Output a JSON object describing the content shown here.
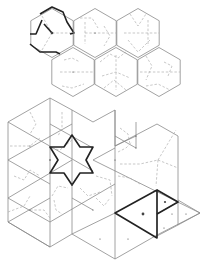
{
  "figure": {
    "colors": {
      "solid": "#8a8a8a",
      "dashed": "#b0b0b0",
      "bold": "#222222",
      "background": "#ffffff"
    },
    "top_panel": {
      "hexagons": [
        {
          "cx": 52,
          "cy": 33,
          "highlighted": true
        },
        {
          "cx": 95,
          "cy": 33,
          "highlighted": false
        },
        {
          "cx": 138,
          "cy": 33,
          "highlighted": false
        },
        {
          "cx": 73,
          "cy": 72,
          "highlighted": false
        },
        {
          "cx": 116,
          "cy": 72,
          "highlighted": false
        },
        {
          "cx": 159,
          "cy": 72,
          "highlighted": false
        }
      ],
      "hex_radius": 24.5
    },
    "bottom_panel": {
      "star": {
        "cx": 72,
        "cy": 160,
        "outer_radius": 26,
        "inner_radius": 15
      },
      "bold_triangle": [
        [
          115,
          213
        ],
        [
          157,
          190
        ],
        [
          157,
          238
        ]
      ],
      "small_bold_triangle": [
        [
          157,
          190
        ],
        [
          178,
          202
        ],
        [
          157,
          214
        ]
      ]
    }
  }
}
